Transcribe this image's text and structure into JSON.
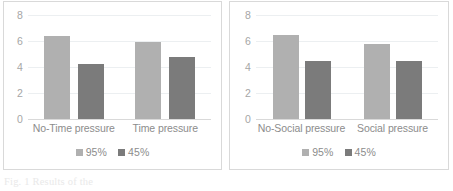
{
  "caption": "Fig. 1  Results of the",
  "legend": {
    "series": [
      {
        "label": "95%",
        "color": "#b0b0b0"
      },
      {
        "label": "45%",
        "color": "#7b7b7b"
      }
    ]
  },
  "chart_data": [
    {
      "type": "bar",
      "title": "",
      "xlabel": "",
      "ylabel": "",
      "categories": [
        "No-Time pressure",
        "Time pressure"
      ],
      "series": [
        {
          "name": "95%",
          "values": [
            6.4,
            5.9
          ],
          "color": "#b0b0b0"
        },
        {
          "name": "45%",
          "values": [
            4.25,
            4.8
          ],
          "color": "#7b7b7b"
        }
      ],
      "yticks": [
        0,
        2,
        4,
        6,
        8
      ],
      "ylim": [
        0,
        8
      ],
      "grid": true,
      "legend_position": "bottom"
    },
    {
      "type": "bar",
      "title": "",
      "xlabel": "",
      "ylabel": "",
      "categories": [
        "No-Social pressure",
        "Social pressure"
      ],
      "series": [
        {
          "name": "95%",
          "values": [
            6.45,
            5.8
          ],
          "color": "#b0b0b0"
        },
        {
          "name": "45%",
          "values": [
            4.5,
            4.5
          ],
          "color": "#7b7b7b"
        }
      ],
      "yticks": [
        0,
        2,
        4,
        6,
        8
      ],
      "ylim": [
        0,
        8
      ],
      "grid": true,
      "legend_position": "bottom"
    }
  ]
}
